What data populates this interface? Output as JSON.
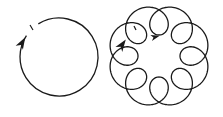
{
  "diagram": {
    "background": "#ffffff",
    "stroke_color": "#1a1a1a",
    "figures": [
      {
        "name": "simple-circle",
        "type": "circle",
        "center": [
          59,
          57
        ],
        "radius": 39,
        "start_tick": [
          32,
          27
        ],
        "arrow": {
          "at": [
            22,
            43
          ],
          "direction": "up-right"
        }
      },
      {
        "name": "looped-orbit",
        "type": "epitrochoid",
        "center": [
          159,
          56
        ],
        "main_radius": 36,
        "loop_radius": 15,
        "loop_count": 8,
        "start_tick": [
          135,
          28
        ],
        "arrows": [
          {
            "at": [
              122,
              45
            ],
            "direction": "up-right"
          },
          {
            "at": [
              155,
              37
            ],
            "direction": "right"
          }
        ]
      }
    ]
  }
}
